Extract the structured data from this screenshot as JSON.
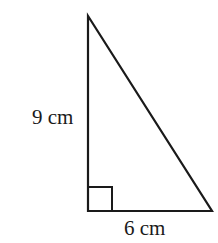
{
  "diagram": {
    "type": "right-triangle",
    "vertical_leg": {
      "label": "9 cm",
      "length": 9,
      "unit": "cm"
    },
    "horizontal_leg": {
      "label": "6 cm",
      "length": 6,
      "unit": "cm"
    },
    "right_angle_marker": "square at bottom-left vertex",
    "stroke_color": "#1a1a1a",
    "background_color": "#ffffff"
  }
}
